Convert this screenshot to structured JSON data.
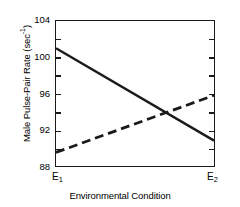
{
  "chart_data": {
    "type": "line",
    "title": "",
    "xlabel": "Environmental Condition",
    "ylabel": "Male Pulse-Pair Rate (sec",
    "ylabel_exponent": "-1",
    "ylabel_suffix": ")",
    "categories": [
      "E1",
      "E2"
    ],
    "x_tick_labels": [
      "E",
      "E"
    ],
    "x_tick_subscripts": [
      "1",
      "2"
    ],
    "ylim": [
      88,
      104
    ],
    "y_ticks": [
      88,
      92,
      96,
      100,
      104
    ],
    "y_tick_labels": [
      "88",
      "92",
      "96",
      "100",
      "104"
    ],
    "y_minor_ticks": [
      90,
      94,
      98,
      102
    ],
    "grid": false,
    "legend": "none",
    "series": [
      {
        "name": "solid-line",
        "style": "solid",
        "color": "#1a1a1a",
        "values": [
          101.0,
          90.8
        ]
      },
      {
        "name": "dashed-line",
        "style": "dashed",
        "color": "#1a1a1a",
        "values": [
          89.5,
          95.8
        ]
      }
    ]
  }
}
